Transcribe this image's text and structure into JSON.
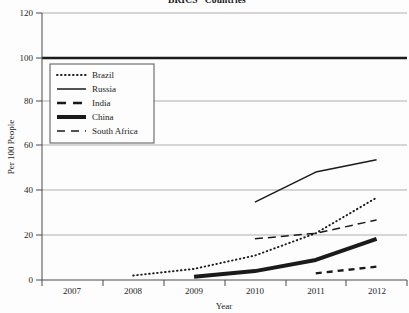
{
  "chart_data": {
    "type": "line",
    "title": "“BRICS” Countries",
    "xlabel": "Year",
    "ylabel": "Per 100 People",
    "x": [
      2007,
      2008,
      2009,
      2010,
      2011,
      2012
    ],
    "xticklabels": [
      "2007",
      "2008",
      "2009",
      "2010",
      "2011",
      "2012"
    ],
    "yticks": [
      0,
      20,
      40,
      60,
      80,
      100,
      120
    ],
    "yticklabels": [
      "0",
      "20",
      "40",
      "60",
      "80",
      "100",
      "120"
    ],
    "ylim": [
      0,
      120
    ],
    "xlim": [
      2006.5,
      2012.5
    ],
    "grid": "horizontal",
    "legend_position": "upper-left-inside",
    "series": [
      {
        "name": "Brazil",
        "style": "dotted",
        "x": [
          2008,
          2009,
          2010,
          2011,
          2012
        ],
        "values": [
          2,
          5,
          11,
          21,
          37
        ]
      },
      {
        "name": "Russia",
        "style": "solid-thin",
        "x": [
          2010,
          2011,
          2012
        ],
        "values": [
          35,
          48.5,
          54
        ]
      },
      {
        "name": "India",
        "style": "dash-short",
        "x": [
          2011,
          2012
        ],
        "values": [
          3,
          6
        ]
      },
      {
        "name": "China",
        "style": "solid-thick",
        "x": [
          2009,
          2010,
          2011,
          2012
        ],
        "values": [
          1.5,
          4,
          9,
          18.5
        ]
      },
      {
        "name": "South Africa",
        "style": "dash-long",
        "x": [
          2010,
          2011,
          2012
        ],
        "values": [
          18.5,
          21,
          27
        ]
      }
    ],
    "reference_line": {
      "name": "reference-100",
      "value": 100,
      "style": "solid-thick-dark"
    },
    "colors": {
      "series_line": "#1a1a1a",
      "gridline": "#9a9a9a",
      "axis": "#4a4a4a",
      "background": "#fdfdfd"
    }
  },
  "legend": {
    "items": [
      {
        "label": "Brazil"
      },
      {
        "label": "Russia"
      },
      {
        "label": "India"
      },
      {
        "label": "China"
      },
      {
        "label": "South Africa"
      }
    ]
  }
}
